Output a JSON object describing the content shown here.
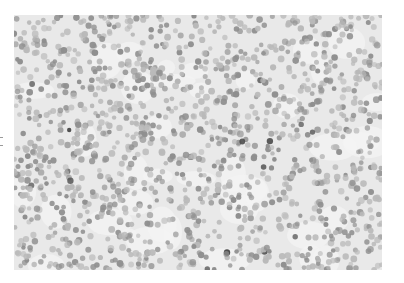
{
  "image": {
    "subject": "micrograph",
    "description": "Grayscale light-microscopy image of densely packed small round cell nuclei",
    "frame": {
      "x": 14,
      "y": 15,
      "width": 368,
      "height": 255
    },
    "background_color": "#e9e9e9",
    "cell_color_light": "#b9b9b9",
    "cell_color_mid": "#8f8f8f",
    "cell_color_dark": "#4a4a4a",
    "approx_cell_count": 1400,
    "cell_radius_px": [
      2.2,
      3.4
    ]
  }
}
